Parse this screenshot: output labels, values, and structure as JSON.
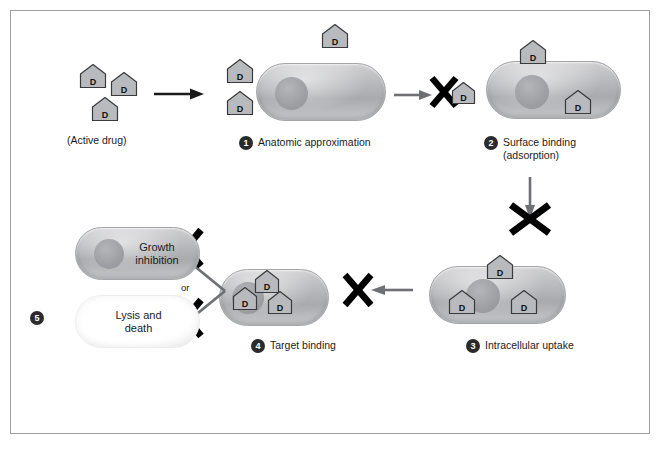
{
  "figure": {
    "border_color": "#9b9ea3",
    "background": "#ffffff"
  },
  "colors": {
    "cell_fill": "#b6b7ba",
    "cell_border": "#a3a5a8",
    "nucleoid": "#9c9da1",
    "drug_fill": "#b9babd",
    "drug_border": "#3a3a3a",
    "x_mark": "#000000",
    "arrow_gray": "#6e7073",
    "arrow_black": "#1a1a1a",
    "badge": "#2b2b2b",
    "text": "#1b1b1b"
  },
  "labels": {
    "active_drug": "(Active drug)",
    "or": "or",
    "growth_inhibition_line1": "Growth",
    "growth_inhibition_line2": "inhibition",
    "lysis_line1": "Lysis and",
    "lysis_line2": "death",
    "drug_letter": "D"
  },
  "steps": [
    {
      "number": "1",
      "line1": "Anatomic approximation",
      "line2": ""
    },
    {
      "number": "2",
      "line1": "Surface binding",
      "line2": "(adsorption)"
    },
    {
      "number": "3",
      "line1": "Intracellular uptake",
      "line2": ""
    },
    {
      "number": "4",
      "line1": "Target binding",
      "line2": ""
    },
    {
      "number": "5",
      "line1": "",
      "line2": ""
    }
  ],
  "caption_fragment": ""
}
